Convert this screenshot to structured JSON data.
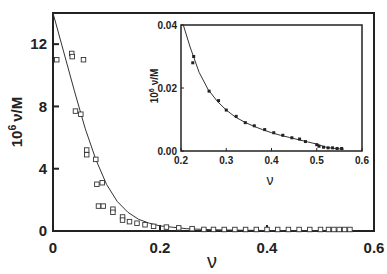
{
  "chart_data": [
    {
      "id": "main",
      "type": "scatter",
      "title": "",
      "xlabel": "ν",
      "ylabel": "10^6 ν/M",
      "ylabel_parts": {
        "base": "10",
        "exp": "6",
        "rest": "ν/M"
      },
      "xlim": [
        0,
        0.6
      ],
      "ylim": [
        0,
        14
      ],
      "grid": false,
      "x_ticks": [
        0,
        0.2,
        0.4,
        0.6
      ],
      "x_tick_labels": [
        "0",
        "0.2",
        "0.4",
        "0.6"
      ],
      "y_ticks": [
        0,
        4,
        8,
        12
      ],
      "y_tick_labels": [
        "0",
        "4",
        "8",
        "12"
      ],
      "series": [
        {
          "name": "data",
          "marker": "open-square",
          "points": [
            [
              0.007,
              11.0
            ],
            [
              0.035,
              11.4
            ],
            [
              0.036,
              11.2
            ],
            [
              0.057,
              11.0
            ],
            [
              0.042,
              7.7
            ],
            [
              0.052,
              7.5
            ],
            [
              0.063,
              5.2
            ],
            [
              0.063,
              4.9
            ],
            [
              0.08,
              4.6
            ],
            [
              0.082,
              3.0
            ],
            [
              0.092,
              3.1
            ],
            [
              0.085,
              1.6
            ],
            [
              0.094,
              1.6
            ],
            [
              0.112,
              1.4
            ],
            [
              0.112,
              1.2
            ],
            [
              0.13,
              0.9
            ],
            [
              0.13,
              0.7
            ],
            [
              0.143,
              0.6
            ],
            [
              0.157,
              0.5
            ],
            [
              0.172,
              0.4
            ],
            [
              0.188,
              0.3
            ],
            [
              0.212,
              0.25
            ],
            [
              0.235,
              0.2
            ],
            [
              0.26,
              0.15
            ],
            [
              0.282,
              0.1
            ],
            [
              0.3,
              0.1
            ],
            [
              0.32,
              0.08
            ],
            [
              0.34,
              0.07
            ],
            [
              0.36,
              0.06
            ],
            [
              0.38,
              0.05
            ],
            [
              0.4,
              0.05
            ],
            [
              0.42,
              0.04
            ],
            [
              0.44,
              0.04
            ],
            [
              0.46,
              0.03
            ],
            [
              0.48,
              0.03
            ],
            [
              0.5,
              0.02
            ],
            [
              0.515,
              0.02
            ],
            [
              0.525,
              0.02
            ],
            [
              0.535,
              0.02
            ],
            [
              0.545,
              0.02
            ],
            [
              0.555,
              0.02
            ]
          ]
        },
        {
          "name": "fit",
          "type": "line",
          "points": [
            [
              0.0,
              14.0
            ],
            [
              0.02,
              11.5
            ],
            [
              0.04,
              9.0
            ],
            [
              0.06,
              6.6
            ],
            [
              0.08,
              4.6
            ],
            [
              0.1,
              3.0
            ],
            [
              0.12,
              1.9
            ],
            [
              0.14,
              1.2
            ],
            [
              0.16,
              0.75
            ],
            [
              0.18,
              0.5
            ],
            [
              0.2,
              0.33
            ],
            [
              0.25,
              0.15
            ],
            [
              0.3,
              0.08
            ],
            [
              0.35,
              0.05
            ],
            [
              0.4,
              0.03
            ],
            [
              0.45,
              0.02
            ],
            [
              0.5,
              0.01
            ],
            [
              0.56,
              0.0
            ]
          ]
        }
      ]
    },
    {
      "id": "inset",
      "type": "scatter",
      "title": "",
      "xlabel": "ν",
      "ylabel": "10^6 ν/M",
      "ylabel_parts": {
        "base": "10",
        "exp": "6",
        "rest": "ν/M"
      },
      "xlim": [
        0.2,
        0.6
      ],
      "ylim": [
        0,
        0.04
      ],
      "grid": false,
      "x_ticks": [
        0.2,
        0.3,
        0.4,
        0.5,
        0.6
      ],
      "x_tick_labels": [
        "0.2",
        "0.3",
        "0.4",
        "0.5",
        "0.6"
      ],
      "y_ticks": [
        0,
        0.02,
        0.04
      ],
      "y_tick_labels": [
        "0.00",
        "0.02",
        "0.04"
      ],
      "series": [
        {
          "name": "data",
          "marker": "filled-square",
          "points": [
            [
              0.228,
              0.03
            ],
            [
              0.226,
              0.028
            ],
            [
              0.262,
              0.019
            ],
            [
              0.283,
              0.016
            ],
            [
              0.3,
              0.013
            ],
            [
              0.322,
              0.011
            ],
            [
              0.342,
              0.009
            ],
            [
              0.362,
              0.008
            ],
            [
              0.385,
              0.0068
            ],
            [
              0.405,
              0.0058
            ],
            [
              0.425,
              0.005
            ],
            [
              0.445,
              0.0042
            ],
            [
              0.462,
              0.0038
            ],
            [
              0.475,
              0.003
            ],
            [
              0.5,
              0.002
            ],
            [
              0.505,
              0.0015
            ],
            [
              0.515,
              0.0012
            ],
            [
              0.525,
              0.001
            ],
            [
              0.535,
              0.001
            ],
            [
              0.545,
              0.0008
            ],
            [
              0.555,
              0.0008
            ]
          ]
        },
        {
          "name": "fit",
          "type": "line",
          "points": [
            [
              0.205,
              0.04
            ],
            [
              0.22,
              0.033
            ],
            [
              0.24,
              0.025
            ],
            [
              0.26,
              0.0195
            ],
            [
              0.28,
              0.0158
            ],
            [
              0.3,
              0.013
            ],
            [
              0.32,
              0.0108
            ],
            [
              0.34,
              0.0092
            ],
            [
              0.36,
              0.0079
            ],
            [
              0.38,
              0.0068
            ],
            [
              0.4,
              0.0058
            ],
            [
              0.42,
              0.005
            ],
            [
              0.44,
              0.0043
            ],
            [
              0.46,
              0.0036
            ],
            [
              0.48,
              0.0029
            ],
            [
              0.5,
              0.0022
            ],
            [
              0.52,
              0.0012
            ],
            [
              0.54,
              0.0008
            ],
            [
              0.56,
              0.0006
            ]
          ]
        }
      ]
    }
  ]
}
